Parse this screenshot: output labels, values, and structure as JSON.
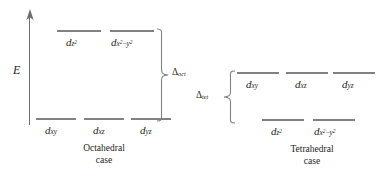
{
  "figure": {
    "energy_axis_label": "E"
  },
  "octahedral": {
    "caption_line1": "Octahedral",
    "caption_line2": "case",
    "splitting": {
      "symbol": "Δ",
      "subscript": "oct"
    },
    "upper_levels": [
      {
        "base": "d",
        "sub": "z",
        "sup": "2",
        "minus": "",
        "sub2": "",
        "sup2": ""
      },
      {
        "base": "d",
        "sub": "x",
        "sup": "2",
        "minus": "−",
        "sub2": "y",
        "sup2": "2"
      }
    ],
    "lower_levels": [
      {
        "base": "d",
        "sub": "xy"
      },
      {
        "base": "d",
        "sub": "xz"
      },
      {
        "base": "d",
        "sub": "yz"
      }
    ]
  },
  "tetrahedral": {
    "caption_line1": "Tetrahedral",
    "caption_line2": "case",
    "splitting": {
      "symbol": "Δ",
      "subscript": "tet"
    },
    "upper_levels": [
      {
        "base": "d",
        "sub": "xy"
      },
      {
        "base": "d",
        "sub": "xz"
      },
      {
        "base": "d",
        "sub": "yz"
      }
    ],
    "lower_levels": [
      {
        "base": "d",
        "sub": "z",
        "sup": "2",
        "minus": "",
        "sub2": "",
        "sup2": ""
      },
      {
        "base": "d",
        "sub": "x",
        "sup": "2",
        "minus": "−",
        "sub2": "y",
        "sup2": "2"
      }
    ]
  },
  "colors": {
    "level": "#808184",
    "axis": "#6d6e70",
    "text": "#231f20",
    "background": "#ffffff"
  }
}
